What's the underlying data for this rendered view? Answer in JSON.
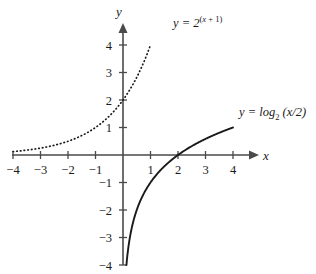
{
  "chart_data": {
    "type": "line",
    "title": "",
    "xlabel": "x",
    "ylabel": "y",
    "xlim": [
      -4,
      4
    ],
    "ylim": [
      -4,
      4
    ],
    "grid": false,
    "legend": "inline-annotations",
    "x_ticks": [
      -4,
      -3,
      -2,
      -1,
      1,
      2,
      3,
      4
    ],
    "y_ticks": [
      4,
      3,
      2,
      1,
      -1,
      -2,
      -3,
      -4
    ],
    "x_tick_labels": [
      "−4",
      "−3",
      "−2",
      "−1",
      "1",
      "2",
      "3",
      "4"
    ],
    "y_tick_labels": [
      "4",
      "3",
      "2",
      "1",
      "−1",
      "−2",
      "−3",
      "−4"
    ],
    "series": [
      {
        "name": "exponential",
        "formula": "2^(x+1)",
        "style": "dotted",
        "x_start": -4,
        "x_end": 1,
        "points": [
          {
            "x": -4.0,
            "y": 0.125
          },
          {
            "x": -3.5,
            "y": 0.177
          },
          {
            "x": -3.0,
            "y": 0.25
          },
          {
            "x": -2.5,
            "y": 0.354
          },
          {
            "x": -2.0,
            "y": 0.5
          },
          {
            "x": -1.5,
            "y": 0.707
          },
          {
            "x": -1.0,
            "y": 1.0
          },
          {
            "x": -0.5,
            "y": 1.414
          },
          {
            "x": 0.0,
            "y": 2.0
          },
          {
            "x": 0.5,
            "y": 2.828
          },
          {
            "x": 1.0,
            "y": 4.0
          }
        ]
      },
      {
        "name": "logarithm",
        "formula": "log2(x/2)",
        "style": "solid",
        "x_start": 0.125,
        "x_end": 4,
        "points": [
          {
            "x": 0.125,
            "y": -4.0
          },
          {
            "x": 0.177,
            "y": -3.5
          },
          {
            "x": 0.25,
            "y": -3.0
          },
          {
            "x": 0.354,
            "y": -2.5
          },
          {
            "x": 0.5,
            "y": -2.0
          },
          {
            "x": 0.707,
            "y": -1.5
          },
          {
            "x": 1.0,
            "y": -1.0
          },
          {
            "x": 1.414,
            "y": -0.5
          },
          {
            "x": 2.0,
            "y": 0.0
          },
          {
            "x": 2.828,
            "y": 0.5
          },
          {
            "x": 4.0,
            "y": 1.0
          }
        ]
      }
    ]
  },
  "labels": {
    "exponential": {
      "lhs": "y = 2",
      "exponent_open": "(",
      "exponent_var": "x",
      "exponent_plus": " + 1",
      "exponent_close": ")"
    },
    "logarithm": {
      "lhs": "y = log",
      "base": "2",
      "arg": " (x/2)"
    }
  },
  "axes": {
    "x_name": "x",
    "y_name": "y"
  },
  "colors": {
    "axis": "#4a4a4a",
    "curve": "#1a1a1a",
    "text": "#1a1a1a",
    "background": "#ffffff"
  }
}
